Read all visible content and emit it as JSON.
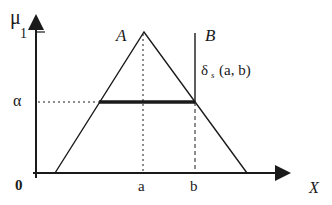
{
  "diagram": {
    "type": "fuzzy-membership",
    "y_axis_label": "μ",
    "y_tick_one": "1",
    "y_tick_alpha": "α",
    "origin_label": "0",
    "x_axis_label": "X",
    "x_tick_a": "a",
    "x_tick_b": "b",
    "set_a_label": "A",
    "set_b_label": "B",
    "distance_label_delta": "δ",
    "distance_label_sub": "s",
    "distance_label_args": "(a, b)",
    "colors": {
      "line": "#1a1a1a",
      "background": "#ffffff"
    }
  }
}
